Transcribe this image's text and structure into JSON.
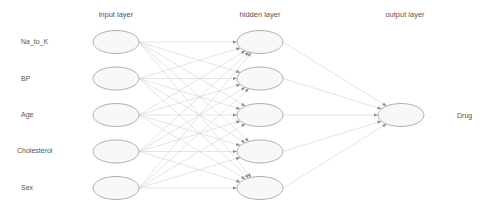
{
  "diagram": {
    "type": "neural-network",
    "layers": [
      {
        "id": "input",
        "title": "input layer",
        "nodes": [
          "Na_to_K",
          "BP",
          "Age",
          "Cholesterol",
          "Sex"
        ]
      },
      {
        "id": "hidden",
        "title": "hidden layer",
        "node_count": 5
      },
      {
        "id": "output",
        "title": "output layer",
        "nodes": [
          "Drug"
        ]
      }
    ],
    "connections": "fully-connected",
    "colors": {
      "node_fill": "#f8f8f8",
      "node_stroke": "#b0b0b0",
      "edge": "#d9d9d9",
      "arrow": "#8a8a8a",
      "text": "#555555"
    }
  }
}
